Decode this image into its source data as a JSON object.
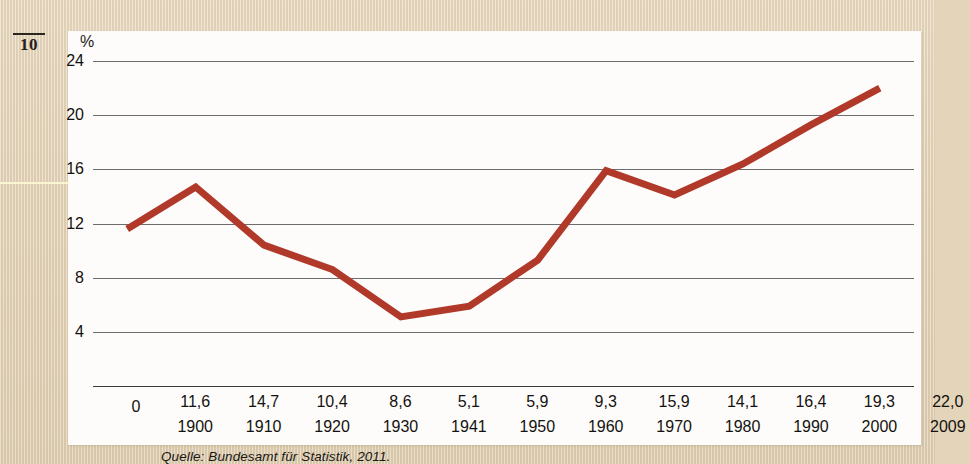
{
  "page_marker": "10",
  "source_note": "Quelle: Bundesamt für Statistik, 2011.",
  "colors": {
    "line": "#b0392a",
    "gridline": "#6d6d6d",
    "panel": "#fdfcfa",
    "paper": "#e4d5bb",
    "text": "#14120f"
  },
  "chart_data": {
    "type": "line",
    "title": "",
    "subtitle": "",
    "xlabel": "",
    "ylabel": "%",
    "unit_label": "%",
    "ylim": [
      0,
      24
    ],
    "yticks": [
      24,
      20,
      16,
      12,
      8,
      4,
      0
    ],
    "ytick_labels": [
      "24",
      "20",
      "16",
      "12",
      "8",
      "4",
      "0"
    ],
    "grid": true,
    "legend": "none",
    "categories": [
      "1900",
      "1910",
      "1920",
      "1930",
      "1941",
      "1950",
      "1960",
      "1970",
      "1980",
      "1990",
      "2000",
      "2009"
    ],
    "values": [
      11.6,
      14.7,
      10.4,
      8.6,
      5.1,
      5.9,
      9.3,
      15.9,
      14.1,
      16.4,
      19.3,
      22.0
    ],
    "value_labels": [
      "11,6",
      "14,7",
      "10,4",
      "8,6",
      "5,1",
      "5,9",
      "9,3",
      "15,9",
      "14,1",
      "16,4",
      "19,3",
      "22,0"
    ],
    "series": [
      {
        "name": "",
        "values": [
          11.6,
          14.7,
          10.4,
          8.6,
          5.1,
          5.9,
          9.3,
          15.9,
          14.1,
          16.4,
          19.3,
          22.0
        ]
      }
    ]
  }
}
